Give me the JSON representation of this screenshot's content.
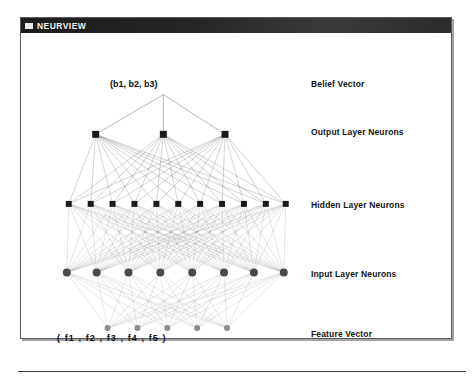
{
  "window": {
    "title": "NEURVIEW",
    "system_menu_icon": "window-menu-icon"
  },
  "diagram": {
    "belief_vector_caption": "(b1, b2, b3)",
    "feature_vector_caption": "(  f1  ,  f2  ,  f3  ,  f4  ,  f5  )",
    "legend": [
      {
        "id": "belief",
        "label": "Belief Vector"
      },
      {
        "id": "output",
        "label": "Output Layer Neurons"
      },
      {
        "id": "hidden",
        "label": "Hidden Layer Neurons"
      },
      {
        "id": "input",
        "label": "Input Layer Neurons"
      },
      {
        "id": "feature",
        "label": "Feature Vector"
      }
    ],
    "colors": {
      "node_dark": "#1a1a1a",
      "node_mid": "#4a4a4a",
      "node_light": "#8c8c8c",
      "edge_light": "#b9b9b9",
      "edge_mid": "#8e8e8e",
      "edge_dark": "#4f4f4f",
      "title_bar": "#262626",
      "window_border": "#5a5a5a",
      "text": "#121212"
    },
    "layers": {
      "belief_apex": {
        "x": 143,
        "y": 62
      },
      "output": {
        "count": 3,
        "y": 102,
        "xs": [
          75,
          143,
          205
        ],
        "shape": "square",
        "size": 7
      },
      "hidden": {
        "count": 11,
        "y": 172,
        "xs": [
          48,
          70,
          92,
          114,
          136,
          158,
          180,
          202,
          224,
          246,
          266
        ],
        "shape": "square",
        "size": 6
      },
      "input": {
        "count": 8,
        "y": 241,
        "xs": [
          46,
          76,
          108,
          140,
          172,
          204,
          234,
          264
        ],
        "shape": "circle",
        "size": 4
      },
      "feature": {
        "count": 5,
        "y": 297,
        "xs": [
          87,
          117,
          147,
          177,
          207
        ],
        "shape": "circle",
        "size": 3
      }
    }
  }
}
